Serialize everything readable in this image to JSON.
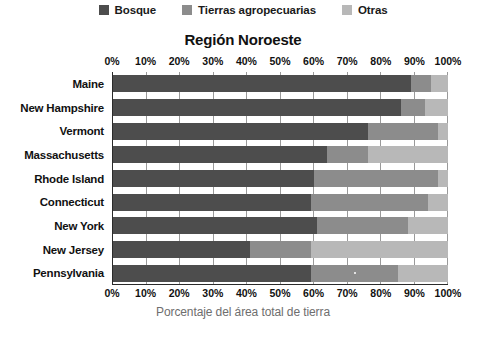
{
  "chart_data": {
    "type": "bar",
    "orientation": "horizontal",
    "stacked": true,
    "normalized_percent": true,
    "title": "Región Noroeste",
    "xlabel": "Porcentaje del área total de tierra",
    "ylabel": "",
    "xlim": [
      0,
      100
    ],
    "grid": true,
    "legend_position": "top",
    "xticks": [
      "0%",
      "10%",
      "20%",
      "30%",
      "40%",
      "50%",
      "60%",
      "70%",
      "80%",
      "90%",
      "100%"
    ],
    "xtick_values": [
      0,
      10,
      20,
      30,
      40,
      50,
      60,
      70,
      80,
      90,
      100
    ],
    "categories": [
      "Maine",
      "New Hampshire",
      "Vermont",
      "Massachusetts",
      "Rhode Island",
      "Connecticut",
      "New York",
      "New Jersey",
      "Pennsylvania"
    ],
    "series": [
      {
        "name": "Bosque",
        "color": "#4d4d4d",
        "values": [
          89,
          86,
          76,
          64,
          60,
          59,
          61,
          41,
          59
        ]
      },
      {
        "name": "Tierras agropecuarias",
        "color": "#8c8c8c",
        "values": [
          6,
          7,
          21,
          12,
          37,
          35,
          27,
          18,
          26
        ]
      },
      {
        "name": "Otras",
        "color": "#b8b8b8",
        "values": [
          5,
          7,
          3,
          24,
          3,
          6,
          12,
          41,
          15
        ]
      }
    ],
    "colors": {
      "bosque": "#4d4d4d",
      "tierras_agropecuarias": "#8c8c8c",
      "otras": "#b8b8b8",
      "axis": "#2b2b2b",
      "gridline": "#9a9a9a",
      "text": "#111111",
      "xlabel_text": "#6e6e6e",
      "background": "#ffffff"
    }
  }
}
